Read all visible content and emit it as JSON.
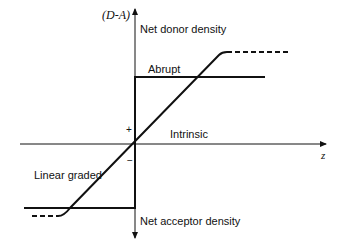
{
  "diagram": {
    "type": "pn-junction doping profile",
    "y_axis": {
      "label": "(D-A)",
      "top_label": "Net donor density",
      "bottom_label": "Net acceptor density"
    },
    "x_axis": {
      "label": "z",
      "center_label": "Intrinsic"
    },
    "signs": {
      "plus": "+",
      "minus": "−"
    },
    "profiles": [
      {
        "name": "Abrupt",
        "label": "Abrupt",
        "style": "solid step"
      },
      {
        "name": "Linear graded",
        "label": "Linear graded",
        "style": "ramp with dashed saturation tails"
      }
    ],
    "colors": {
      "line": "#111111",
      "background": "#ffffff"
    }
  }
}
